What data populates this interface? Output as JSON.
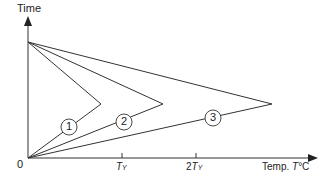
{
  "diagram": {
    "y_axis_label": "Time",
    "x_axis_label_prefix": "Temp. ",
    "x_axis_label_var": "T",
    "x_axis_label_unit": "°C",
    "origin_label": "0",
    "ticks": [
      {
        "coef": "",
        "var": "T",
        "sub": "Y"
      },
      {
        "coef": "2",
        "var": "T",
        "sub": "Y"
      }
    ],
    "curves": [
      {
        "id": "1",
        "label": "1"
      },
      {
        "id": "2",
        "label": "2"
      },
      {
        "id": "3",
        "label": "3"
      }
    ],
    "line_color": "#333333"
  }
}
